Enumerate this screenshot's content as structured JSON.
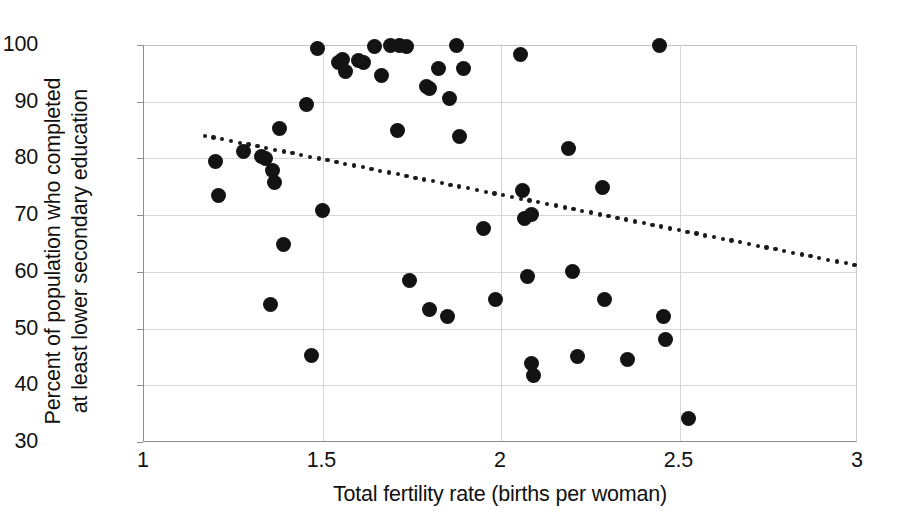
{
  "chart_data": {
    "type": "scatter",
    "title": "",
    "xlabel": "Total fertility rate (births per woman)",
    "ylabel_line1": "Percent of population who completed",
    "ylabel_line2": "at least lower secondary education",
    "xlim": [
      1,
      3
    ],
    "ylim": [
      30,
      100
    ],
    "xticks": [
      "1",
      "1.5",
      "2",
      "2.5",
      "3"
    ],
    "xtick_values": [
      1,
      1.5,
      2,
      2.5,
      3
    ],
    "yticks": [
      "30",
      "40",
      "50",
      "60",
      "70",
      "80",
      "90",
      "100"
    ],
    "ytick_values": [
      30,
      40,
      50,
      60,
      70,
      80,
      90,
      100
    ],
    "grid": true,
    "legend": "none",
    "marker_color": "#131313",
    "gridline_color": "#d6d6d6",
    "axis_color": "#8e8e8e",
    "points": [
      [
        1.2,
        79.4
      ],
      [
        1.21,
        73.5
      ],
      [
        1.28,
        81.2
      ],
      [
        1.33,
        80.3
      ],
      [
        1.34,
        79.9
      ],
      [
        1.355,
        54.2
      ],
      [
        1.36,
        77.9
      ],
      [
        1.365,
        75.8
      ],
      [
        1.38,
        85.3
      ],
      [
        1.39,
        64.8
      ],
      [
        1.455,
        89.5
      ],
      [
        1.47,
        45.3
      ],
      [
        1.485,
        99.3
      ],
      [
        1.5,
        70.9
      ],
      [
        1.545,
        96.9
      ],
      [
        1.555,
        97.5
      ],
      [
        1.565,
        95.3
      ],
      [
        1.6,
        97.3
      ],
      [
        1.615,
        96.9
      ],
      [
        1.645,
        99.8
      ],
      [
        1.665,
        94.7
      ],
      [
        1.69,
        99.9
      ],
      [
        1.71,
        84.9
      ],
      [
        1.715,
        100.0
      ],
      [
        1.735,
        99.8
      ],
      [
        1.745,
        58.5
      ],
      [
        1.79,
        92.6
      ],
      [
        1.8,
        53.3
      ],
      [
        1.8,
        92.3
      ],
      [
        1.825,
        95.8
      ],
      [
        1.85,
        52.2
      ],
      [
        1.855,
        90.6
      ],
      [
        1.875,
        100.0
      ],
      [
        1.885,
        83.9
      ],
      [
        1.895,
        95.8
      ],
      [
        1.95,
        67.7
      ],
      [
        1.985,
        55.2
      ],
      [
        2.055,
        98.3
      ],
      [
        2.06,
        74.4
      ],
      [
        2.065,
        69.4
      ],
      [
        2.075,
        59.2
      ],
      [
        2.085,
        70.1
      ],
      [
        2.085,
        43.9
      ],
      [
        2.09,
        41.8
      ],
      [
        2.19,
        81.8
      ],
      [
        2.2,
        60.1
      ],
      [
        2.215,
        45.1
      ],
      [
        2.285,
        74.8
      ],
      [
        2.29,
        55.2
      ],
      [
        2.355,
        44.5
      ],
      [
        2.445,
        100.0
      ],
      [
        2.455,
        52.2
      ],
      [
        2.46,
        48.0
      ],
      [
        2.525,
        34.2
      ]
    ],
    "trendline": {
      "style": "dotted",
      "x_start": 1.17,
      "y_start": 84.0,
      "x_end": 2.99,
      "y_end": 61.2
    }
  }
}
